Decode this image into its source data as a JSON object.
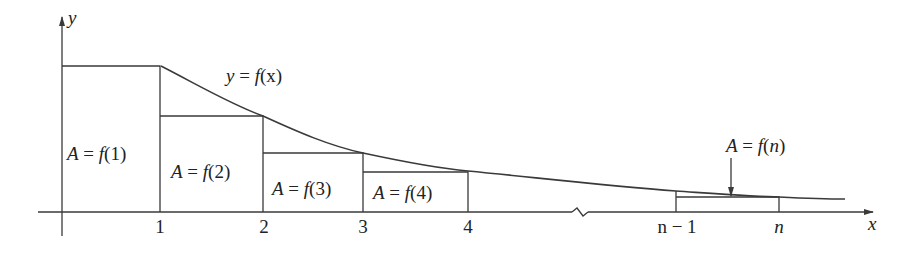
{
  "diagram": {
    "curve_label": "y = f(x)",
    "axes": {
      "x_label": "x",
      "y_label": "y"
    },
    "ticks": [
      {
        "label": "1",
        "x": 160
      },
      {
        "label": "2",
        "x": 263
      },
      {
        "label": "3",
        "x": 363
      },
      {
        "label": "4",
        "x": 468
      },
      {
        "label": "n − 1",
        "x": 676
      },
      {
        "label": "n",
        "x": 779
      }
    ],
    "rectangles": [
      {
        "label": "A = f(1)",
        "from": "0",
        "to": "1"
      },
      {
        "label": "A = f(2)",
        "from": "1",
        "to": "2"
      },
      {
        "label": "A = f(3)",
        "from": "2",
        "to": "3"
      },
      {
        "label": "A = f(4)",
        "from": "3",
        "to": "4"
      },
      {
        "label": "A = f(n)",
        "from": "n − 1",
        "to": "n"
      }
    ],
    "axis_break": true,
    "colors": {
      "line": "#3a3a3a",
      "text": "#222222",
      "background": "#ffffff"
    }
  },
  "text": {
    "y_axis": "y",
    "x_axis": "x",
    "curve": {
      "y": "y",
      "eq": " = ",
      "f": "f",
      "arg": "(x)"
    },
    "r1": {
      "A": "A",
      "eq": " = ",
      "f": "f",
      "arg": "(1)"
    },
    "r2": {
      "A": "A",
      "eq": " = ",
      "f": "f",
      "arg": "(2)"
    },
    "r3": {
      "A": "A",
      "eq": " = ",
      "f": "f",
      "arg": "(3)"
    },
    "r4": {
      "A": "A",
      "eq": " = ",
      "f": "f",
      "arg": "(4)"
    },
    "rn": {
      "A": "A",
      "eq": " = ",
      "f": "f",
      "arg_open": "(",
      "n": "n",
      "arg_close": ")"
    },
    "tick1": "1",
    "tick2": "2",
    "tick3": "3",
    "tick4": "4",
    "tick_nm1": "n − 1",
    "tick_n": "n"
  }
}
